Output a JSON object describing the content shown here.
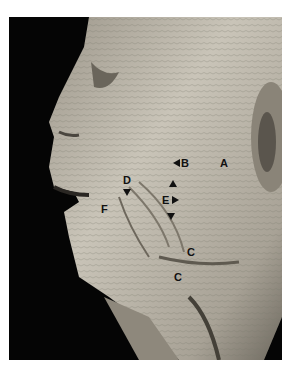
{
  "figure": {
    "labels": [
      {
        "id": "A",
        "text": "A"
      },
      {
        "id": "B",
        "text": "B"
      },
      {
        "id": "C1",
        "text": "C"
      },
      {
        "id": "C2",
        "text": "C"
      },
      {
        "id": "D",
        "text": "D"
      },
      {
        "id": "E",
        "text": "E"
      },
      {
        "id": "F",
        "text": "F"
      }
    ],
    "markers": [
      "arrowhead-left-B",
      "arrowhead-down-D",
      "arrowhead-up-E",
      "arrowhead-right-E",
      "arrowhead-down-E"
    ],
    "colors": {
      "background": "#050505",
      "tissue": "#b8b2a6",
      "label": "#111111"
    }
  }
}
